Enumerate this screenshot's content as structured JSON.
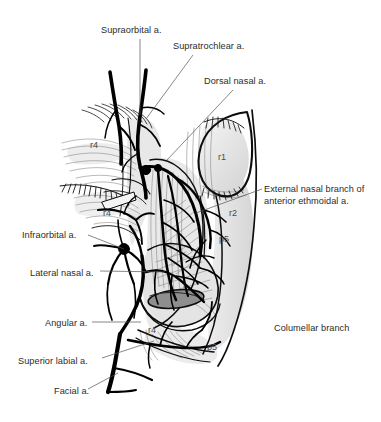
{
  "figure": {
    "background_color": "#ffffff",
    "ink_color": "#111111",
    "text_color": "#2b2b2b",
    "shade_color": "#d9d9d9"
  },
  "labels": [
    {
      "id": "supraorbital",
      "text": "Supraorbital a.",
      "x": 101,
      "y": 25,
      "align": "left"
    },
    {
      "id": "supratrochlear",
      "text": "Supratrochlear a.",
      "x": 173,
      "y": 41,
      "align": "left"
    },
    {
      "id": "dorsal-nasal",
      "text": "Dorsal nasal a.",
      "x": 204,
      "y": 76,
      "align": "left"
    },
    {
      "id": "external-nasal-l1",
      "text": "External nasal branch of",
      "x": 264,
      "y": 184,
      "align": "left"
    },
    {
      "id": "external-nasal-l2",
      "text": "anterior ethmoidal a.",
      "x": 264,
      "y": 196,
      "align": "left"
    },
    {
      "id": "infraorbital",
      "text": "Infraorbital a.",
      "x": 22,
      "y": 230,
      "align": "left"
    },
    {
      "id": "lateral-nasal",
      "text": "Lateral nasal a.",
      "x": 30,
      "y": 268,
      "align": "left"
    },
    {
      "id": "angular",
      "text": "Angular a.",
      "x": 45,
      "y": 318,
      "align": "left"
    },
    {
      "id": "superior-labial",
      "text": "Superior labial a.",
      "x": 18,
      "y": 356,
      "align": "left"
    },
    {
      "id": "facial",
      "text": "Facial a.",
      "x": 54,
      "y": 386,
      "align": "left"
    },
    {
      "id": "columellar-branch",
      "text": "Columellar branch",
      "x": 274,
      "y": 323,
      "align": "left"
    }
  ],
  "region_markers": [
    {
      "id": "r4-brow",
      "text": "r4",
      "x": 90,
      "y": 140
    },
    {
      "id": "r4-cheek",
      "text": "r4",
      "x": 103,
      "y": 208
    },
    {
      "id": "r4-ala",
      "text": "r4",
      "x": 148,
      "y": 325
    },
    {
      "id": "r1-tip",
      "text": "r1",
      "x": 218,
      "y": 152
    },
    {
      "id": "r2-dorsum",
      "text": "r2",
      "x": 229,
      "y": 208
    },
    {
      "id": "p5-upper",
      "text": "p5",
      "x": 219,
      "y": 234
    },
    {
      "id": "p5-lower",
      "text": "p5",
      "x": 207,
      "y": 342
    }
  ],
  "leader_lines": [
    {
      "id": "leader-supraorbital",
      "d": "M 140 39 L 140 115"
    },
    {
      "id": "leader-supratrochlear",
      "d": "M 193 55 L 146 119"
    },
    {
      "id": "leader-dorsal-nasal",
      "d": "M 233 90 L 167 160"
    },
    {
      "id": "leader-external-nasal",
      "d": "M 262 189 L 196 213"
    },
    {
      "id": "leader-infraorbital",
      "d": "M 88 235 L 124 249"
    },
    {
      "id": "leader-lateral-nasal",
      "d": "M 100 271 L 165 272"
    },
    {
      "id": "leader-angular",
      "d": "M 92 322 L 141 322"
    },
    {
      "id": "leader-superior-labial",
      "d": "M 102 358 L 154 341"
    },
    {
      "id": "leader-facial",
      "d": "M 88 389 L 118 373"
    }
  ],
  "anatomy": {
    "arteries": [
      {
        "name": "supraorbital-artery-trunk",
        "label": "Supraorbital a."
      },
      {
        "name": "supratrochlear-artery-trunk",
        "label": "Supratrochlear a."
      },
      {
        "name": "dorsal-nasal-artery",
        "label": "Dorsal nasal a."
      },
      {
        "name": "external-nasal-branch",
        "label": "External nasal branch of anterior ethmoidal a."
      },
      {
        "name": "infraorbital-artery",
        "label": "Infraorbital a."
      },
      {
        "name": "lateral-nasal-artery",
        "label": "Lateral nasal a."
      },
      {
        "name": "angular-artery",
        "label": "Angular a."
      },
      {
        "name": "superior-labial-artery",
        "label": "Superior labial a."
      },
      {
        "name": "facial-artery",
        "label": "Facial a."
      },
      {
        "name": "columellar-branch-artery",
        "label": "Columellar branch"
      }
    ],
    "structures": [
      "nasal-dorsum-outline",
      "nasal-tip-lobule",
      "alar-cartilage",
      "nostril-opening",
      "eyebrow-hairs",
      "eyelash-row",
      "nasalis-muscle-fibers",
      "levator-labii-fibers"
    ]
  }
}
